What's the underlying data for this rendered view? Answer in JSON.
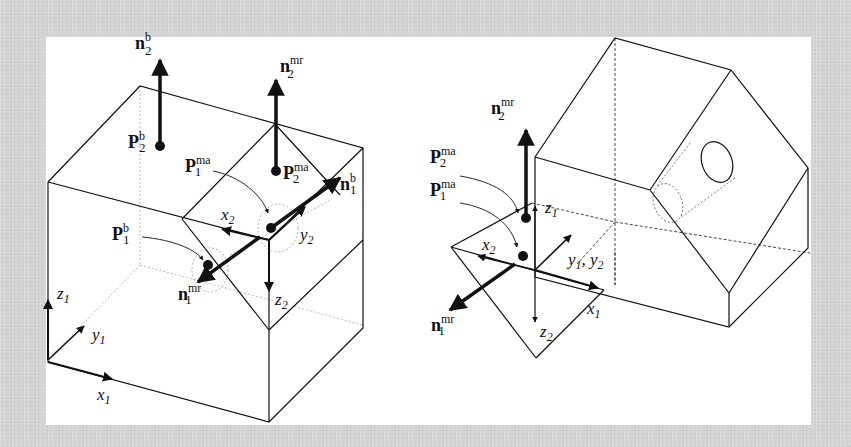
{
  "figure": {
    "background_color": "#d4d4d4",
    "panel_color": "#ffffff",
    "stroke_color": "#111111"
  },
  "left_diagram": {
    "description": "Box with wedge-shaped mating part on top; base and mate frames",
    "labels": {
      "n2b": {
        "base": "n",
        "sub": "2",
        "sup": "b"
      },
      "n2mr": {
        "base": "n",
        "sub": "2",
        "sup": "mr"
      },
      "P2b": {
        "base": "P",
        "sub": "2",
        "sup": "b"
      },
      "P1ma": {
        "base": "P",
        "sub": "1",
        "sup": "ma"
      },
      "P2ma": {
        "base": "P",
        "sub": "2",
        "sup": "ma"
      },
      "n1b": {
        "base": "n",
        "sub": "1",
        "sup": "b"
      },
      "P1b": {
        "base": "P",
        "sub": "1",
        "sup": "b"
      },
      "n1mr": {
        "base": "n",
        "sub": "1",
        "sup": "mr"
      },
      "x2": {
        "base": "x",
        "sub": "2"
      },
      "y2": {
        "base": "y",
        "sub": "2"
      },
      "z2": {
        "base": "z",
        "sub": "2"
      },
      "z1": {
        "base": "z",
        "sub": "1"
      },
      "y1": {
        "base": "y",
        "sub": "1"
      },
      "x1": {
        "base": "x",
        "sub": "1"
      }
    }
  },
  "right_diagram": {
    "description": "Hexagonal prism with through hole mated to wedge; coincident frames",
    "labels": {
      "n2mr": {
        "base": "n",
        "sub": "2",
        "sup": "mr"
      },
      "P2ma": {
        "base": "P",
        "sub": "2",
        "sup": "ma"
      },
      "P1ma": {
        "base": "P",
        "sub": "1",
        "sup": "ma"
      },
      "z1": {
        "base": "z",
        "sub": "1"
      },
      "x2": {
        "base": "x",
        "sub": "2"
      },
      "y1y2": {
        "a": "y",
        "a_sub": "1",
        "sep": ", ",
        "b": "y",
        "b_sub": "2"
      },
      "x1": {
        "base": "x",
        "sub": "1"
      },
      "n1mr": {
        "base": "n",
        "sub": "1",
        "sup": "mr"
      },
      "z2": {
        "base": "z",
        "sub": "2"
      }
    }
  }
}
